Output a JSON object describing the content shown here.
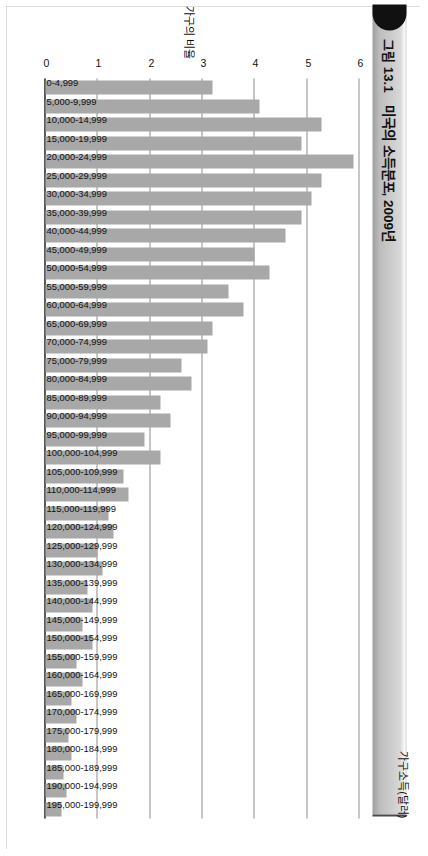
{
  "figure": {
    "number": "그림 13.1",
    "title": "미국의 소득분포, 2009년"
  },
  "chart_data": {
    "type": "bar",
    "orientation": "horizontal",
    "title": "미국의 소득분포, 2009년",
    "xlabel": "가구소득(달러)",
    "ylabel": "가구의 비율",
    "ylim": [
      0,
      6
    ],
    "yticks": [
      "6",
      "5",
      "4",
      "3",
      "2",
      "1",
      "0"
    ],
    "ytick_values": [
      6,
      5,
      4,
      3,
      2,
      1,
      0
    ],
    "grid": true,
    "legend": "none",
    "bar_color": "#a8a8a8",
    "categories": [
      "0-4,999",
      "5,000-9,999",
      "10,000-14,999",
      "15,000-19,999",
      "20,000-24,999",
      "25,000-29,999",
      "30,000-34,999",
      "35,000-39,999",
      "40,000-44,999",
      "45,000-49,999",
      "50,000-54,999",
      "55,000-59,999",
      "60,000-64,999",
      "65,000-69,999",
      "70,000-74,999",
      "75,000-79,999",
      "80,000-84,999",
      "85,000-89,999",
      "90,000-94,999",
      "95,000-99,999",
      "100,000-104,999",
      "105,000-109,999",
      "110,000-114,999",
      "115,000-119,999",
      "120,000-124,999",
      "125,000-129,999",
      "130,000-134,999",
      "135,000-139,999",
      "140,000-144,999",
      "145,000-149,999",
      "150,000-154,999",
      "155,000-159,999",
      "160,000-164,999",
      "165,000-169,999",
      "170,000-174,999",
      "175,000-179,999",
      "180,000-184,999",
      "185,000-189,999",
      "190,000-194,999",
      "195,000-199,999"
    ],
    "values": [
      3.2,
      4.1,
      5.3,
      4.9,
      5.9,
      5.3,
      5.1,
      4.9,
      4.6,
      4.0,
      4.3,
      3.5,
      3.8,
      3.2,
      3.1,
      2.6,
      2.8,
      2.2,
      2.4,
      1.9,
      2.2,
      1.5,
      1.6,
      1.2,
      1.3,
      1.0,
      1.1,
      0.8,
      0.9,
      0.7,
      0.9,
      0.6,
      0.7,
      0.5,
      0.6,
      0.45,
      0.5,
      0.35,
      0.4,
      0.3
    ]
  }
}
